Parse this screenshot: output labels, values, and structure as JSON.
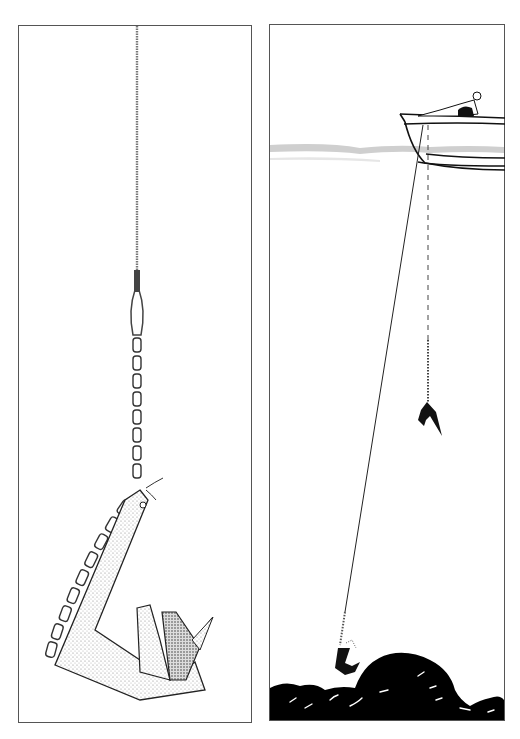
{
  "figure": {
    "left_panel": {
      "subject": "grapnel-style anchor hanging from rope with chain leader",
      "elements": [
        "rope",
        "rope-splice-thimble",
        "chain",
        "anchor-shank",
        "anchor-fluke"
      ]
    },
    "right_panel": {
      "subject": "boat at surface with two anchor lines to the seabed",
      "elements": [
        "boat",
        "person-in-boat",
        "water-surface",
        "anchor-rode-slanted",
        "dashed-vertical-line",
        "hanging-anchor",
        "anchor-on-seabed",
        "rocky-seabed"
      ]
    },
    "caption_partial": ""
  },
  "colors": {
    "ink": "#111111",
    "border": "#555555",
    "water": "#cfcfcf",
    "stipple": "#9a9a9a",
    "background": "#ffffff"
  }
}
